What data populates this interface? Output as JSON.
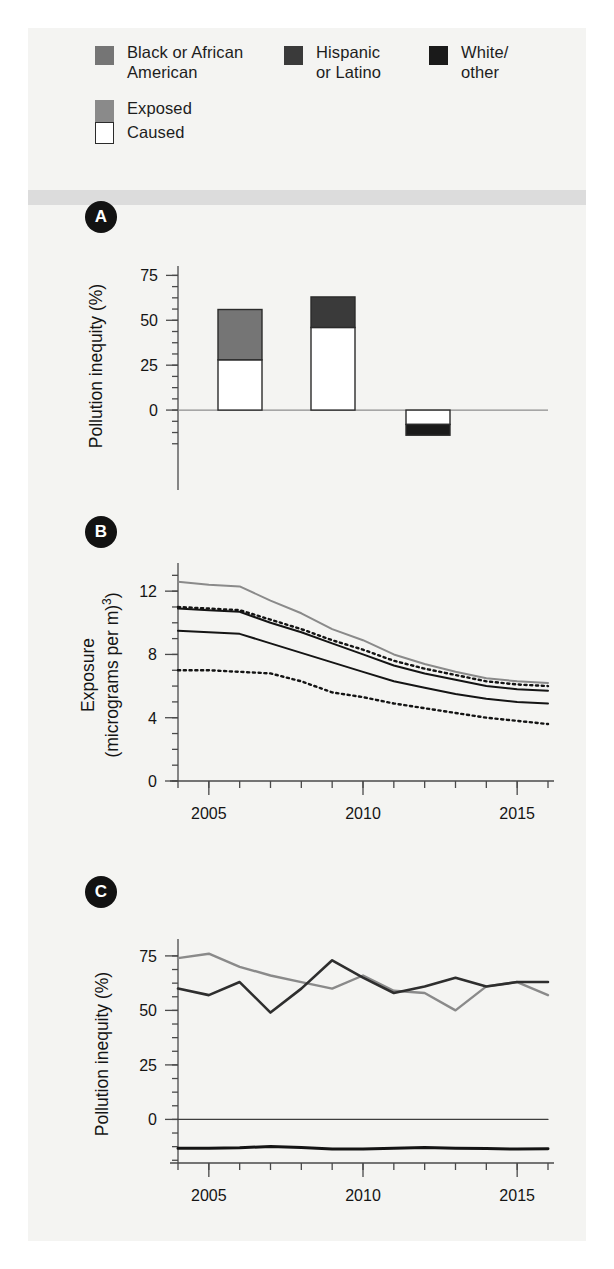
{
  "legend": {
    "groups": [
      {
        "id": "black",
        "label": "Black or African\nAmerican",
        "color": "#757575",
        "swatch": "legend-swatch-black"
      },
      {
        "id": "hispanic",
        "label": "Hispanic\nor Latino",
        "color": "#3a3a3a",
        "swatch": "legend-swatch-hispanic"
      },
      {
        "id": "white",
        "label": "White/\nother",
        "color": "#1a1a1a",
        "swatch": "legend-swatch-white"
      }
    ],
    "measures": [
      {
        "id": "exposed",
        "label": "Exposed",
        "color": "#8a8a8a"
      },
      {
        "id": "caused",
        "label": "Caused",
        "color": "#ffffff"
      }
    ]
  },
  "panels": [
    {
      "id": "A",
      "badge": "A"
    },
    {
      "id": "B",
      "badge": "B"
    },
    {
      "id": "C",
      "badge": "C"
    }
  ],
  "chart_data": [
    {
      "panel": "A",
      "type": "bar",
      "title": "",
      "xlabel": "",
      "ylabel": "Pollution inequity (%)",
      "ylim": [
        -20,
        78
      ],
      "yticks": [
        0,
        25,
        50,
        75
      ],
      "ytick_labels": [
        "0",
        "25",
        "50",
        "75"
      ],
      "minor_tick_step": 6.25,
      "grid": false,
      "legend_position": "top",
      "categories": [
        "Black or African American",
        "Hispanic or Latino",
        "White/other"
      ],
      "series": [
        {
          "name": "Caused",
          "values": [
            28.0,
            46.0,
            -8.0
          ],
          "fill": "#ffffff",
          "stroke": "#2b2b2b"
        },
        {
          "name": "Exposed",
          "values": [
            56.0,
            63.0,
            -14.0
          ],
          "fill_by_category": [
            "#757575",
            "#3a3a3a",
            "#1a1a1a"
          ],
          "stroke": "#2b2b2b"
        }
      ],
      "notes": "Stacked: white 'Caused' segment drawn from 0 to Caused value; colored 'Exposed' segment from Caused value to Exposed total."
    },
    {
      "panel": "B",
      "type": "line",
      "title": "",
      "xlabel": "",
      "ylabel": "Exposure\n(micrograms per m³)",
      "ylim": [
        0,
        13.4
      ],
      "yticks": [
        0,
        4,
        8,
        12
      ],
      "ytick_labels": [
        "0",
        "4",
        "8",
        "12"
      ],
      "minor_tick_step": 1,
      "xlim": [
        2004,
        2016
      ],
      "xticks": [
        2005,
        2010,
        2015
      ],
      "xtick_labels": [
        "2005",
        "2010",
        "2015"
      ],
      "x_minor_step": 1,
      "grid": false,
      "x": [
        2004,
        2005,
        2006,
        2007,
        2008,
        2009,
        2010,
        2011,
        2012,
        2013,
        2014,
        2015,
        2016
      ],
      "series": [
        {
          "name": "Black or African American exposed",
          "style": "solid",
          "color": "#8a8a8a",
          "width": 2.0,
          "values": [
            12.6,
            12.4,
            12.3,
            11.4,
            10.6,
            9.6,
            8.9,
            8.0,
            7.4,
            6.9,
            6.5,
            6.3,
            6.2
          ]
        },
        {
          "name": "Hispanic or Latino exposed",
          "style": "dotted",
          "color": "#141414",
          "width": 2.4,
          "values": [
            11.0,
            10.9,
            10.8,
            10.2,
            9.6,
            8.9,
            8.3,
            7.6,
            7.1,
            6.7,
            6.3,
            6.1,
            6.0
          ]
        },
        {
          "name": "Total exposed",
          "style": "solid",
          "color": "#141414",
          "width": 2.0,
          "values": [
            10.9,
            10.8,
            10.7,
            10.0,
            9.4,
            8.7,
            8.0,
            7.3,
            6.8,
            6.4,
            6.0,
            5.8,
            5.7
          ]
        },
        {
          "name": "White/other exposed",
          "style": "solid",
          "color": "#141414",
          "width": 2.0,
          "values": [
            9.5,
            9.4,
            9.3,
            8.7,
            8.1,
            7.5,
            6.9,
            6.3,
            5.9,
            5.5,
            5.2,
            5.0,
            4.9
          ]
        },
        {
          "name": "Caused lower series",
          "style": "dotted",
          "color": "#141414",
          "width": 2.4,
          "values": [
            7.0,
            7.0,
            6.9,
            6.8,
            6.3,
            5.6,
            5.3,
            4.9,
            4.6,
            4.3,
            4.0,
            3.8,
            3.6
          ]
        }
      ]
    },
    {
      "panel": "C",
      "type": "line",
      "title": "",
      "xlabel": "",
      "ylabel": "Pollution inequity (%)",
      "ylim": [
        -20,
        80
      ],
      "yticks": [
        0,
        25,
        50,
        75
      ],
      "ytick_labels": [
        "0",
        "25",
        "50",
        "75"
      ],
      "minor_tick_step": 6.25,
      "xlim": [
        2004,
        2016
      ],
      "xticks": [
        2005,
        2010,
        2015
      ],
      "xtick_labels": [
        "2005",
        "2010",
        "2015"
      ],
      "x_minor_step": 1,
      "grid": false,
      "x": [
        2004,
        2005,
        2006,
        2007,
        2008,
        2009,
        2010,
        2011,
        2012,
        2013,
        2014,
        2015,
        2016
      ],
      "series": [
        {
          "name": "Black or African American",
          "style": "solid",
          "color": "#8a8a8a",
          "width": 2.4,
          "values": [
            74,
            76,
            70,
            66,
            63,
            60,
            66,
            59,
            58,
            50,
            61,
            63,
            57
          ]
        },
        {
          "name": "Hispanic or Latino",
          "style": "solid",
          "color": "#2e2e2e",
          "width": 2.6,
          "values": [
            60,
            57,
            63,
            49,
            60,
            73,
            65,
            58,
            61,
            65,
            61,
            63,
            63
          ]
        },
        {
          "name": "Zero reference",
          "style": "solid",
          "color": "#3d3d3d",
          "width": 1.2,
          "values": [
            0,
            0,
            0,
            0,
            0,
            0,
            0,
            0,
            0,
            0,
            0,
            0,
            0
          ]
        },
        {
          "name": "White/other",
          "style": "solid",
          "color": "#141414",
          "width": 3.0,
          "values": [
            -13.2,
            -13.2,
            -13.0,
            -12.4,
            -12.9,
            -13.6,
            -13.6,
            -13.2,
            -12.9,
            -13.2,
            -13.4,
            -13.6,
            -13.5
          ]
        }
      ]
    }
  ]
}
